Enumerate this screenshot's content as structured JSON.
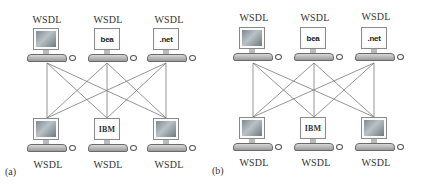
{
  "panels": [
    {
      "id": "(a)",
      "top_nodes": [
        {
          "label": "WSDL",
          "screen": "cloud"
        },
        {
          "label": "WSDL",
          "screen": "bea",
          "logo_text": "bea"
        },
        {
          "label": "WSDL",
          "screen": "dotnet",
          "logo_text": ".net"
        }
      ],
      "bottom_nodes": [
        {
          "label": "WSDL",
          "screen": "cloud"
        },
        {
          "label": "WSDL",
          "screen": "ibm",
          "logo_text": "IBM"
        },
        {
          "label": "WSDL",
          "screen": "cloud"
        }
      ],
      "connections": "full-mesh: every top node linked to every bottom node"
    },
    {
      "id": "(b)",
      "top_nodes": [
        {
          "label": "WSDL",
          "screen": "cloud"
        },
        {
          "label": "WSDL",
          "screen": "bea",
          "logo_text": "bea"
        },
        {
          "label": "WSDL",
          "screen": "dotnet",
          "logo_text": ".net"
        }
      ],
      "bottom_nodes": [
        {
          "label": "WSDL",
          "screen": "cloud"
        },
        {
          "label": "WSDL",
          "screen": "ibm",
          "logo_text": "IBM"
        },
        {
          "label": "WSDL",
          "screen": "cloud"
        }
      ],
      "connections": "full-mesh: every top node linked to every bottom node"
    }
  ],
  "colors": {
    "line": "#7a7a7a",
    "text": "#333333"
  }
}
